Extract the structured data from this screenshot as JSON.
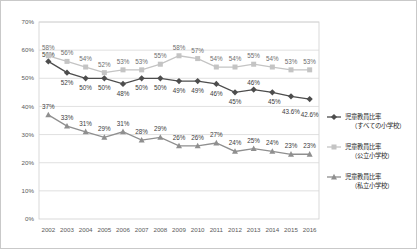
{
  "chart_data": {
    "type": "line",
    "title": "",
    "xlabel": "",
    "ylabel": "",
    "ylim": [
      0,
      70
    ],
    "ytick_labels": [
      "0%",
      "10%",
      "20%",
      "30%",
      "40%",
      "50%",
      "60%",
      "70%"
    ],
    "ytick_values": [
      0,
      10,
      20,
      30,
      40,
      50,
      60,
      70
    ],
    "grid": true,
    "legend_position": "right",
    "categories": [
      "2002",
      "2003",
      "2004",
      "2005",
      "2006",
      "2007",
      "2008",
      "2009",
      "2010",
      "2011",
      "2012",
      "2013",
      "2014",
      "2015",
      "2016"
    ],
    "series": [
      {
        "name": "児童教員比率（すべての小学校）",
        "legend_line1": "児童教員比率",
        "legend_line2": "（すべての小学校）",
        "marker": "diamond",
        "color": "#4d4d4d",
        "values": [
          56,
          52,
          50,
          50,
          48,
          50,
          50,
          49,
          49,
          48,
          45,
          46,
          45,
          43.6,
          42.6
        ],
        "labels": [
          "56%",
          "52%",
          "50%",
          "50%",
          "48%",
          "50%",
          "50%",
          "49%",
          "49%",
          "46%",
          "45%",
          "46%",
          "45%",
          "43.6%",
          "42.6%"
        ]
      },
      {
        "name": "児童教員比率（公立小学校）",
        "legend_line1": "児童教員比率",
        "legend_line2": "（公立小学校）",
        "marker": "square",
        "color": "#c4c4c4",
        "values": [
          58,
          56,
          54,
          52,
          53,
          53,
          55,
          58,
          57,
          54,
          54,
          55,
          54,
          53,
          53
        ],
        "labels": [
          "58%",
          "56%",
          "54%",
          "52%",
          "53%",
          "53%",
          "55%",
          "58%",
          "57%",
          "54%",
          "54%",
          "55%",
          "54%",
          "53%",
          "53%"
        ]
      },
      {
        "name": "児童教員比率（私立小学校）",
        "legend_line1": "児童教員比率",
        "legend_line2": "（私立小学校）",
        "marker": "triangle",
        "color": "#8f8f8f",
        "values": [
          37,
          33,
          31,
          29,
          31,
          28,
          29,
          26,
          26,
          27,
          24,
          25,
          24,
          23,
          23
        ],
        "labels": [
          "37%",
          "33%",
          "31%",
          "29%",
          "31%",
          "28%",
          "29%",
          "26%",
          "26%",
          "27%",
          "24%",
          "25%",
          "24%",
          "23%",
          "23%"
        ]
      }
    ]
  }
}
